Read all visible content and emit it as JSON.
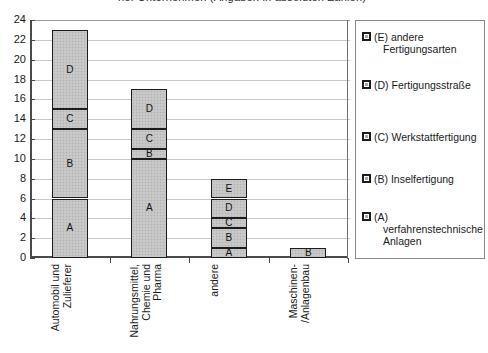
{
  "title_partial": "ner Unternehmen (Angaben in absoluten Zahlen)",
  "chart_data": {
    "type": "bar",
    "subtype": "stacked-bar",
    "title": "",
    "xlabel": "",
    "ylabel": "",
    "ylim": [
      0,
      24
    ],
    "yticks": [
      0,
      2,
      4,
      6,
      8,
      10,
      12,
      14,
      16,
      18,
      20,
      22,
      24
    ],
    "grid": true,
    "legend_position": "right",
    "categories": [
      "Automobil und Zulieferer",
      "Nahrungsmittel, Chemie und Pharma",
      "andere",
      "Maschinen-/Anlagenbau"
    ],
    "series": [
      {
        "name": "(A) verfahrenstechnische Anlagen",
        "key": "A",
        "values": [
          6,
          10,
          1,
          0
        ]
      },
      {
        "name": "(B) Inselfertigung",
        "key": "B",
        "values": [
          7,
          1,
          2,
          1
        ]
      },
      {
        "name": "(C) Werkstattfertigung",
        "key": "C",
        "values": [
          2,
          2,
          1,
          0
        ]
      },
      {
        "name": "(D) Fertigungsstraße",
        "key": "D",
        "values": [
          8,
          4,
          2,
          0
        ]
      },
      {
        "name": "(E) andere Fertigungsarten",
        "key": "E",
        "values": [
          0,
          0,
          2,
          0
        ]
      }
    ],
    "totals": [
      23,
      17,
      8,
      1
    ]
  },
  "axis": {
    "ytick_labels": [
      "24",
      "22",
      "20",
      "18",
      "16",
      "14",
      "12",
      "10",
      "8",
      "6",
      "4",
      "2",
      "0"
    ]
  },
  "categories_wrapped": [
    [
      "Automobil und",
      "Zulieferer"
    ],
    [
      "Nahrungsmittel,",
      "Chemie und",
      "Pharma"
    ],
    [
      "andere"
    ],
    [
      "Maschinen-",
      "/Anlagenbau"
    ]
  ],
  "legend": {
    "items": [
      {
        "key": "E",
        "lines": [
          "(E) andere"
        ],
        "indented": [
          "Fertigungsarten"
        ]
      },
      {
        "key": "D",
        "lines": [
          "(D) Fertigungsstraße"
        ],
        "indented": []
      },
      {
        "key": "C",
        "lines": [
          "(C) Werkstattfertigung"
        ],
        "indented": []
      },
      {
        "key": "B",
        "lines": [
          "(B) Inselfertigung"
        ],
        "indented": []
      },
      {
        "key": "A",
        "lines": [
          "(A)"
        ],
        "indented": [
          "verfahrenstechnische",
          "Anlagen"
        ]
      }
    ]
  },
  "colors": {
    "bar_fill": "#c4c4c4",
    "bar_border": "#1c1c1c",
    "grid": "#c8c8c8",
    "axis": "#4a4a4a",
    "legend_border": "#8a8a8a"
  }
}
